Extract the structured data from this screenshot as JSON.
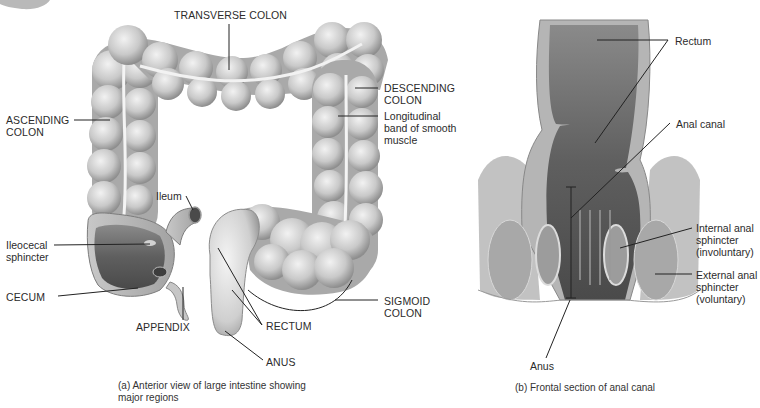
{
  "figure_a": {
    "caption": "(a) Anterior view of large intestine showing\n     major regions",
    "labels": {
      "transverse_colon": "TRANSVERSE COLON",
      "descending_colon": "DESCENDING\nCOLON",
      "longitudinal_band": "Longitudinal\nband of smooth\nmuscle",
      "ascending_colon": "ASCENDING\nCOLON",
      "ileum": "Ileum",
      "ileocecal_sphincter": "Ileocecal\nsphincter",
      "cecum": "CECUM",
      "appendix": "APPENDIX",
      "rectum": "RECTUM",
      "sigmoid_colon": "SIGMOID\nCOLON",
      "anus": "ANUS"
    }
  },
  "figure_b": {
    "caption": "(b) Frontal section of anal canal",
    "labels": {
      "rectum": "Rectum",
      "anal_canal": "Anal canal",
      "internal_sphincter": "Internal anal\nsphincter\n(involuntary)",
      "external_sphincter": "External anal\nsphincter\n(voluntary)",
      "anus": "Anus"
    }
  },
  "colors": {
    "tissue_light": "#d9d9d9",
    "tissue_mid": "#b4b4b4",
    "tissue_dark": "#6e6e6e",
    "leader_line": "#222222"
  }
}
